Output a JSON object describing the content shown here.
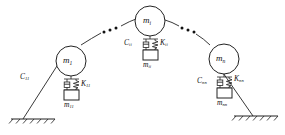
{
  "figure": {
    "type": "mechanical-schematic",
    "stroke_color": "#222222",
    "background_color": "#ffffff"
  },
  "masses": [
    {
      "id": "left",
      "main_symbol": "m",
      "main_sub": "1",
      "damper_symbol": "C",
      "damper_sub": "11",
      "spring_symbol": "K",
      "spring_sub": "11",
      "sub_mass_symbol": "m",
      "sub_mass_sub": "11"
    },
    {
      "id": "center",
      "main_symbol": "m",
      "main_sub": "i",
      "damper_symbol": "C",
      "damper_sub": "ii",
      "spring_symbol": "K",
      "spring_sub": "ii",
      "sub_mass_symbol": "m",
      "sub_mass_sub": "ii"
    },
    {
      "id": "right",
      "main_symbol": "m",
      "main_sub": "n",
      "damper_symbol": "C",
      "damper_sub": "nn",
      "spring_symbol": "K",
      "spring_sub": "nn",
      "sub_mass_symbol": "m",
      "sub_mass_sub": "nn"
    }
  ],
  "ellipses": [
    {
      "id": "left-gap",
      "glyph": "•••"
    },
    {
      "id": "right-gap",
      "glyph": "•••"
    }
  ],
  "supports": [
    {
      "id": "ground-left",
      "kind": "fixed-hatched-ground"
    },
    {
      "id": "ground-right",
      "kind": "fixed-hatched-ground"
    }
  ]
}
